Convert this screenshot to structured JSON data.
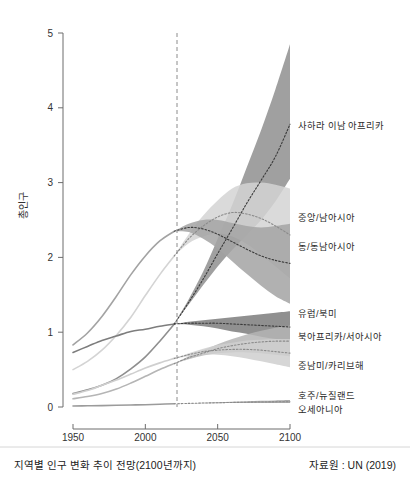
{
  "caption": {
    "title": "지역별 인구 변화 추이 전망(2100년까지)",
    "source": "자료원 : UN (2019)"
  },
  "axes": {
    "ylabel": "총인구",
    "yticks": [
      "0",
      "1",
      "2",
      "3",
      "4",
      "5"
    ],
    "xticks": [
      "1950",
      "2000",
      "2050",
      "2100"
    ]
  },
  "labels": {
    "africa": "사하라 이남 아프리카",
    "central_south_asia": "중앙/남아시아",
    "east_southeast_asia": "동/동남아시아",
    "europe_north_america": "유럽/북미",
    "north_africa_west_asia": "북아프리카/서아시아",
    "latin_america": "중남미/카리브해",
    "oceania_line1": "호주/뉴질랜드",
    "oceania_line2": "오세아니아"
  },
  "chart_data": {
    "type": "line",
    "title": "지역별 인구 변화 추이 전망(2100년까지)",
    "subtitle": "",
    "xlabel": "",
    "ylabel": "총인구",
    "xlim": [
      1950,
      2100
    ],
    "ylim": [
      0,
      5
    ],
    "grid": false,
    "legend": "right-inline-labels",
    "units": "billions",
    "projection_start_year": 2020,
    "annotations": [
      {
        "type": "vertical-dashed-line",
        "x": 2020,
        "note": "역사 자료와 전망의 경계"
      }
    ],
    "x": [
      1950,
      1960,
      1970,
      1980,
      1990,
      2000,
      2010,
      2020,
      2030,
      2040,
      2050,
      2060,
      2070,
      2080,
      2090,
      2100
    ],
    "series": [
      {
        "name": "사하라 이남 아프리카",
        "color": "#8f8f8f",
        "values": [
          0.18,
          0.23,
          0.29,
          0.38,
          0.51,
          0.67,
          0.88,
          1.11,
          1.4,
          1.71,
          2.05,
          2.38,
          2.72,
          3.03,
          3.35,
          3.78
        ],
        "band_low": [
          0.18,
          0.23,
          0.29,
          0.38,
          0.51,
          0.67,
          0.88,
          1.11,
          1.37,
          1.63,
          1.88,
          2.1,
          2.3,
          2.5,
          2.75,
          3.05
        ],
        "band_high": [
          0.18,
          0.23,
          0.29,
          0.38,
          0.51,
          0.67,
          0.88,
          1.11,
          1.44,
          1.81,
          2.25,
          2.7,
          3.2,
          3.7,
          4.25,
          4.85
        ]
      },
      {
        "name": "중앙/남아시아",
        "color": "#d4d4d4",
        "values": [
          0.5,
          0.61,
          0.76,
          0.96,
          1.2,
          1.49,
          1.77,
          2.02,
          2.25,
          2.42,
          2.54,
          2.6,
          2.58,
          2.52,
          2.42,
          2.3
        ],
        "band_low": [
          0.5,
          0.61,
          0.76,
          0.96,
          1.2,
          1.49,
          1.77,
          2.02,
          2.19,
          2.28,
          2.32,
          2.28,
          2.18,
          2.04,
          1.88,
          1.72
        ],
        "band_high": [
          0.5,
          0.61,
          0.76,
          0.96,
          1.2,
          1.49,
          1.77,
          2.02,
          2.31,
          2.56,
          2.76,
          2.92,
          2.99,
          3.0,
          2.97,
          2.92
        ]
      },
      {
        "name": "동/동남아시아",
        "color": "#a3a3a3",
        "values": [
          0.83,
          0.99,
          1.21,
          1.48,
          1.77,
          2.02,
          2.22,
          2.35,
          2.4,
          2.38,
          2.31,
          2.21,
          2.11,
          2.02,
          1.96,
          1.92
        ],
        "band_low": [
          0.83,
          0.99,
          1.21,
          1.48,
          1.77,
          2.02,
          2.22,
          2.35,
          2.34,
          2.25,
          2.12,
          1.95,
          1.78,
          1.62,
          1.48,
          1.38
        ],
        "band_high": [
          0.83,
          0.99,
          1.21,
          1.48,
          1.77,
          2.02,
          2.22,
          2.35,
          2.45,
          2.5,
          2.5,
          2.46,
          2.42,
          2.4,
          2.42,
          2.45
        ]
      },
      {
        "name": "유럽/북미",
        "color": "#7d7d7d",
        "values": [
          0.73,
          0.81,
          0.89,
          0.95,
          1.01,
          1.04,
          1.08,
          1.11,
          1.12,
          1.12,
          1.12,
          1.11,
          1.1,
          1.09,
          1.08,
          1.07
        ],
        "band_low": [
          0.73,
          0.81,
          0.89,
          0.95,
          1.01,
          1.04,
          1.08,
          1.11,
          1.1,
          1.08,
          1.05,
          1.01,
          0.98,
          0.94,
          0.91,
          0.88
        ],
        "band_high": [
          0.73,
          0.81,
          0.89,
          0.95,
          1.01,
          1.04,
          1.08,
          1.11,
          1.14,
          1.16,
          1.18,
          1.2,
          1.22,
          1.24,
          1.26,
          1.28
        ]
      },
      {
        "name": "북아프리카/서아시아",
        "color": "#b5b5b5",
        "values": [
          0.11,
          0.14,
          0.18,
          0.24,
          0.32,
          0.41,
          0.5,
          0.58,
          0.66,
          0.72,
          0.78,
          0.82,
          0.85,
          0.87,
          0.88,
          0.88
        ],
        "band_low": [
          0.11,
          0.14,
          0.18,
          0.24,
          0.32,
          0.41,
          0.5,
          0.58,
          0.64,
          0.69,
          0.72,
          0.73,
          0.73,
          0.72,
          0.7,
          0.68
        ],
        "band_high": [
          0.11,
          0.14,
          0.18,
          0.24,
          0.32,
          0.41,
          0.5,
          0.58,
          0.68,
          0.76,
          0.84,
          0.91,
          0.97,
          1.02,
          1.06,
          1.09
        ]
      },
      {
        "name": "중남미/카리브해",
        "color": "#cfcfcf",
        "values": [
          0.17,
          0.22,
          0.29,
          0.36,
          0.44,
          0.52,
          0.59,
          0.65,
          0.7,
          0.74,
          0.76,
          0.77,
          0.77,
          0.76,
          0.74,
          0.72
        ],
        "band_low": [
          0.17,
          0.22,
          0.29,
          0.36,
          0.44,
          0.52,
          0.59,
          0.65,
          0.68,
          0.7,
          0.7,
          0.68,
          0.65,
          0.61,
          0.57,
          0.53
        ],
        "band_high": [
          0.17,
          0.22,
          0.29,
          0.36,
          0.44,
          0.52,
          0.59,
          0.65,
          0.72,
          0.78,
          0.83,
          0.86,
          0.89,
          0.9,
          0.91,
          0.91
        ]
      },
      {
        "name": "호주/뉴질랜드 오세아니아",
        "color": "#9b9b9b",
        "values": [
          0.013,
          0.016,
          0.019,
          0.023,
          0.027,
          0.031,
          0.037,
          0.043,
          0.048,
          0.053,
          0.057,
          0.061,
          0.064,
          0.067,
          0.069,
          0.071
        ],
        "band_low": [
          0.013,
          0.016,
          0.019,
          0.023,
          0.027,
          0.031,
          0.037,
          0.043,
          0.046,
          0.049,
          0.051,
          0.053,
          0.054,
          0.055,
          0.055,
          0.055
        ],
        "band_high": [
          0.013,
          0.016,
          0.019,
          0.023,
          0.027,
          0.031,
          0.037,
          0.043,
          0.05,
          0.057,
          0.064,
          0.07,
          0.076,
          0.082,
          0.087,
          0.092
        ]
      }
    ]
  }
}
